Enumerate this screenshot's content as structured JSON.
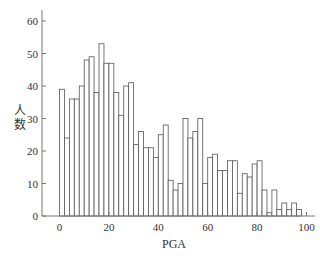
{
  "chart_data": {
    "type": "bar",
    "subtype": "histogram",
    "title": "",
    "xlabel": "PGA",
    "ylabel": "人数",
    "bin_width": 2,
    "bin_starts": [
      0,
      2,
      4,
      6,
      8,
      10,
      12,
      14,
      16,
      18,
      20,
      22,
      24,
      26,
      28,
      30,
      32,
      34,
      36,
      38,
      40,
      42,
      44,
      46,
      48,
      50,
      52,
      54,
      56,
      58,
      60,
      62,
      64,
      66,
      68,
      70,
      72,
      74,
      76,
      78,
      80,
      82,
      84,
      86,
      88,
      90,
      92,
      94,
      96
    ],
    "values": [
      39,
      24,
      36,
      36,
      40,
      48,
      49,
      38,
      53,
      47,
      47,
      38,
      31,
      40,
      41,
      22,
      26,
      21,
      21,
      18,
      25,
      28,
      11,
      8,
      10,
      30,
      24,
      26,
      30,
      10,
      18,
      19,
      14,
      14,
      17,
      17,
      7,
      13,
      12,
      16,
      17,
      8,
      1,
      8,
      2,
      4,
      2,
      4,
      2
    ],
    "xlim": [
      -7,
      104
    ],
    "ylim": [
      0,
      64
    ],
    "x_ticks": [
      0,
      20,
      40,
      60,
      80,
      100
    ],
    "y_ticks": [
      0,
      10,
      20,
      30,
      40,
      50,
      60
    ],
    "grid": false,
    "legend": null,
    "bar_fill": "#ffffff",
    "bar_edge": "#555555"
  },
  "axes": {
    "x_tick_labels": [
      "0",
      "20",
      "40",
      "60",
      "80",
      "100"
    ],
    "y_tick_labels": [
      "0",
      "10",
      "20",
      "30",
      "40",
      "50",
      "60"
    ],
    "xlabel": "PGA",
    "ylabel_chars": [
      "人",
      "数"
    ]
  }
}
